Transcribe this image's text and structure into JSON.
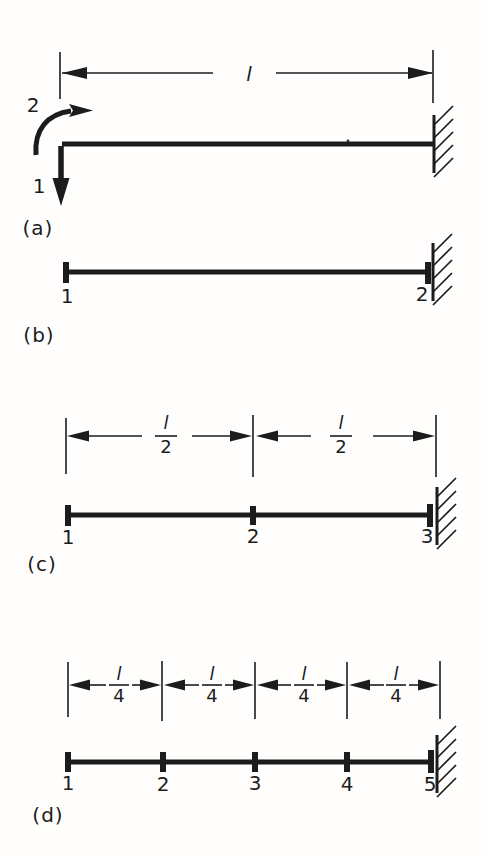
{
  "colors": {
    "ink": "#1c1c1c",
    "paper": "#fffefd"
  },
  "parts": {
    "a": {
      "label": "(a)",
      "span_label": "l",
      "dof_rotation_label": "2",
      "dof_translation_label": "1"
    },
    "b": {
      "label": "(b)",
      "nodes": [
        "1",
        "2"
      ]
    },
    "c": {
      "label": "(c)",
      "nodes": [
        "1",
        "2",
        "3"
      ],
      "fraction": {
        "numerator": "l",
        "denominator": "2"
      }
    },
    "d": {
      "label": "(d)",
      "nodes": [
        "1",
        "2",
        "3",
        "4",
        "5"
      ],
      "fraction": {
        "numerator": "l",
        "denominator": "4"
      }
    }
  }
}
